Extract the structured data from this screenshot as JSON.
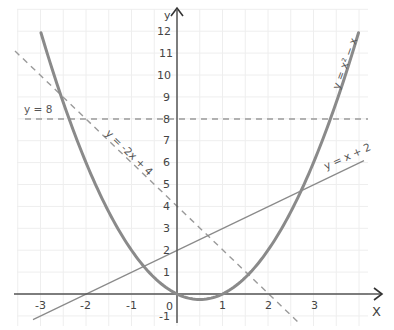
{
  "chart_data": {
    "type": "line",
    "title": "",
    "xlabel": "X",
    "ylabel": "y",
    "xlim": [
      -3.5,
      4.1
    ],
    "ylim": [
      -1.3,
      13
    ],
    "grid": true,
    "grid_step_x": 0.5,
    "grid_step_y": 1,
    "x_ticks": [
      -3,
      -2,
      -1,
      0,
      1,
      2,
      3
    ],
    "x_tick_labels": [
      "-3",
      "-2",
      "-1",
      "0",
      "1",
      "2",
      "3"
    ],
    "y_ticks": [
      -1,
      1,
      2,
      3,
      4,
      5,
      6,
      7,
      8,
      9,
      10,
      11,
      12
    ],
    "y_tick_labels": [
      "-1",
      "1",
      "2",
      "3",
      "4",
      "5",
      "6",
      "7",
      "8",
      "9",
      "10",
      "11",
      "12"
    ],
    "legend": "none (inline labels)",
    "series": [
      {
        "name": "y = x² − x",
        "style": "solid-thick",
        "color": "#8a8a8a",
        "function": "x^2 - x",
        "x_range": [
          -2.99,
          3.99
        ],
        "points": [
          [
            -3,
            12
          ],
          [
            -2,
            6
          ],
          [
            -1,
            2
          ],
          [
            0,
            0
          ],
          [
            0.5,
            -0.25
          ],
          [
            1,
            0
          ],
          [
            2,
            2
          ],
          [
            3,
            6
          ],
          [
            3.99,
            11.93
          ]
        ]
      },
      {
        "name": "y = -2x + 4",
        "style": "dashed",
        "color": "#9a9a9a",
        "function": "-2x + 4",
        "x_range": [
          -3.55,
          2.65
        ],
        "points": [
          [
            -3.55,
            11.1
          ],
          [
            -2,
            8
          ],
          [
            0,
            4
          ],
          [
            2,
            0
          ],
          [
            2.65,
            -1.3
          ]
        ]
      },
      {
        "name": "y = x + 2",
        "style": "solid-thin",
        "color": "#8a8a8a",
        "function": "x + 2",
        "x_range": [
          -3.17,
          4.1
        ],
        "points": [
          [
            -3.17,
            -1.17
          ],
          [
            -2,
            0
          ],
          [
            0,
            2
          ],
          [
            2,
            4
          ],
          [
            4.1,
            6.1
          ]
        ]
      },
      {
        "name": "y = 8",
        "style": "dashed",
        "color": "#9a9a9a",
        "function": "8",
        "x_range": [
          -3.35,
          4.2
        ],
        "points": [
          [
            -3.35,
            8
          ],
          [
            4.2,
            8
          ]
        ]
      }
    ],
    "annotations": [
      {
        "text": "y = 8",
        "x": -3.2,
        "y": 8.3
      },
      {
        "text": "y = -2x + 4",
        "x": -1.2,
        "y": 6.5,
        "rotation": 45
      },
      {
        "text": "y = x² − x",
        "x": 3.6,
        "y": 10,
        "rotation": -70
      },
      {
        "text": "y = x + 2",
        "x": 3.55,
        "y": 5.8,
        "rotation": -22
      }
    ]
  },
  "labels": {
    "x_axis": "X",
    "y_axis": "y",
    "origin": "0",
    "line_y8": "y = 8",
    "line_neg2x4": "y = -2x + 4",
    "curve_parabola": "y = x² − x",
    "line_x2": "y = x + 2"
  },
  "ticks": {
    "x": [
      "-3",
      "-2",
      "-1",
      "1",
      "2",
      "3"
    ],
    "y_pos": [
      "1",
      "2",
      "3",
      "4",
      "5",
      "6",
      "7",
      "8",
      "9",
      "10",
      "11",
      "12"
    ],
    "y_neg": "-1"
  }
}
